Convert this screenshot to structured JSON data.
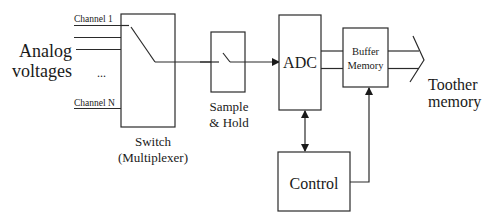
{
  "diagram": {
    "input_label_line1": "Analog",
    "input_label_line2": "voltages",
    "channel_first": "Channel 1",
    "channel_last": "Channel N",
    "ellipsis": "...",
    "switch_label_line1": "Switch",
    "switch_label_line2": "(Multiplexer)",
    "sample_hold_line1": "Sample",
    "sample_hold_line2": "& Hold",
    "adc_label": "ADC",
    "buffer_line1": "Buffer",
    "buffer_line2": "Memory",
    "control_label": "Control",
    "output_line1": "Toother",
    "output_line2": "memory"
  },
  "colors": {
    "stroke": "#2a2a2a",
    "text": "#1a1a1a",
    "background": "#ffffff"
  }
}
